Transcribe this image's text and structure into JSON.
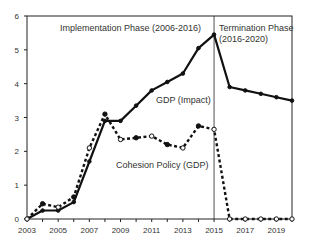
{
  "chart_data": {
    "type": "line",
    "title": "",
    "xlabel": "",
    "ylabel": "",
    "x": [
      2003,
      2004,
      2005,
      2006,
      2007,
      2008,
      2009,
      2010,
      2011,
      2012,
      2013,
      2014,
      2015,
      2016,
      2017,
      2018,
      2019,
      2020
    ],
    "x_tick_labels": [
      "2003",
      "2005",
      "2007",
      "2009",
      "2011",
      "2013",
      "2015",
      "2017",
      "2019"
    ],
    "y_tick_labels": [
      "0",
      "1",
      "2",
      "3",
      "4",
      "5",
      "6"
    ],
    "xlim": [
      2003,
      2020
    ],
    "ylim": [
      0,
      6
    ],
    "grid": false,
    "series": [
      {
        "name": "GDP (Impact)",
        "style": "solid",
        "color": "#111111",
        "values": [
          0,
          0.25,
          0.25,
          0.5,
          1.7,
          2.9,
          2.9,
          3.35,
          3.8,
          4.05,
          4.3,
          5.05,
          5.45,
          3.9,
          3.8,
          3.7,
          3.6,
          3.5
        ]
      },
      {
        "name": "Cohesion Policy (GDP)",
        "style": "dashed",
        "color": "#111111",
        "values": [
          0,
          0.45,
          0.35,
          0.65,
          2.1,
          3.1,
          2.35,
          2.4,
          2.45,
          2.2,
          2.1,
          2.75,
          2.65,
          0,
          0,
          0,
          0,
          0
        ]
      }
    ],
    "annotations": [
      {
        "text": "Implementation Phase (2006-2016)",
        "x": 2008.5,
        "y": 5.7
      },
      {
        "text": "Termination Phase",
        "x": 2015.3,
        "y": 5.7
      },
      {
        "text": "(2016-2020)",
        "x": 2015.3,
        "y": 5.3
      },
      {
        "text": "GDP (Impact)",
        "x": 2011.0,
        "y": 3.45
      },
      {
        "text": "Cohesion Policy (GDP)",
        "x": 2009.6,
        "y": 1.9
      }
    ],
    "vertical_line": {
      "x": 2015,
      "meaning": "phase divider"
    },
    "legend": "none (inline labels)"
  },
  "labels": {
    "implementation": "Implementation Phase (2006-2016)",
    "termination_line1": "Termination Phase",
    "termination_line2": "(2016-2020)",
    "gdp_label": "GDP (Impact)",
    "cohesion_label": "Cohesion Policy (GDP)"
  }
}
